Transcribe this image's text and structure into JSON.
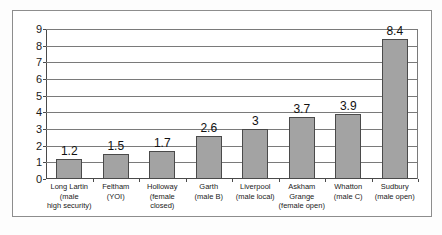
{
  "chart_data": {
    "type": "bar",
    "title": "",
    "subtitle": "",
    "xlabel": "",
    "ylabel": "",
    "ylim": [
      0,
      9
    ],
    "grid": true,
    "legend": "none",
    "orientation": "vertical",
    "bar_color": "#a3a3a3",
    "bar_edge_color": "#4a4a4a",
    "show_value_labels": true,
    "y_ticks": [
      "0",
      "1",
      "2",
      "3",
      "4",
      "5",
      "6",
      "7",
      "8",
      "9"
    ],
    "y_tick_values": [
      0,
      1,
      2,
      3,
      4,
      5,
      6,
      7,
      8,
      9
    ],
    "categories": [
      "Long Lartin (male high security)",
      "Feltham (YOI)",
      "Holloway (female closed)",
      "Garth (male B)",
      "Liverpool (male local)",
      "Askham Grange (female open)",
      "Whatton (male C)",
      "Sudbury (male open)"
    ],
    "category_lines": [
      [
        "Long Lartin",
        "(male",
        "high security)"
      ],
      [
        "Feltham",
        "(YOI)"
      ],
      [
        "Holloway",
        "(female",
        "closed)"
      ],
      [
        "Garth",
        "(male B)"
      ],
      [
        "Liverpool",
        "(male local)"
      ],
      [
        "Askham",
        "Grange",
        "(female open)"
      ],
      [
        "Whatton",
        "(male C)"
      ],
      [
        "Sudbury",
        "(male open)"
      ]
    ],
    "values": [
      1.2,
      1.5,
      1.7,
      2.6,
      3,
      3.7,
      3.9,
      8.4
    ],
    "value_labels": [
      "1.2",
      "1.5",
      "1.7",
      "2.6",
      "3",
      "3.7",
      "3.9",
      "8.4"
    ]
  },
  "figure": {
    "background": "#ffffff",
    "frame_color": "#8d8d8d"
  }
}
